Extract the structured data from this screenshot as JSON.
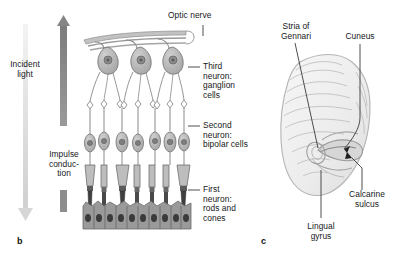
{
  "figure": {
    "type": "anatomical-illustration",
    "background_color": "#ffffff",
    "ink_color": "#16181a"
  },
  "panels": [
    {
      "letter": "b",
      "name": "retina-layers",
      "caption_letter": "b"
    },
    {
      "letter": "c",
      "name": "occipital-brain",
      "caption_letter": "c"
    }
  ],
  "panel_b": {
    "letter": "b",
    "arrows": {
      "incident_light": {
        "label": "Incident\nlight",
        "direction": "down",
        "color": "#d9d9d9"
      },
      "impulse_conduction": {
        "label": "Impulse\nconduc-\ntion",
        "direction": "up",
        "color": "#8a8a8a"
      }
    },
    "labels": {
      "optic_nerve": "Optic nerve",
      "third_neuron": "Third\nneuron:\nganglion\ncells",
      "second_neuron": "Second\nneuron:\nbipolar cells",
      "first_neuron": "First\nneuron:\nrods and\ncones"
    }
  },
  "panel_c": {
    "letter": "c",
    "labels": {
      "stria_of_gennari": "Stria of\nGennari",
      "cuneus": "Cuneus",
      "calcarine_sulcus": "Calcarine\nsulcus",
      "lingual_gyrus": "Lingual\ngyrus"
    }
  },
  "colors": {
    "cell_fill": "#b6b6b6",
    "cell_stroke": "#6e6e6e",
    "nucleus": "#7d7d7d",
    "pigment_epithelium": "#4a4a4a",
    "brain_fill": "#efefef",
    "brain_stroke": "#b0b0b0",
    "leader_line": "#333333"
  }
}
